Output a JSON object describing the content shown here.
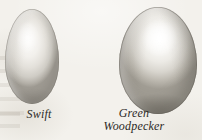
{
  "plate": {
    "background_color": "#f3f1ec",
    "ink_color": "#2c2a26",
    "subject": "bird-egg-comparison-plate"
  },
  "specimens": [
    {
      "id": "swift",
      "caption_lines": [
        "Swift"
      ],
      "shape": "elongated-oval",
      "shell_color": "#e9e6e0",
      "highlight_color": "#fbfaf8",
      "shadow_color": "#9e9a92"
    },
    {
      "id": "green-woodpecker",
      "caption_lines": [
        "Green",
        "Woodpecker"
      ],
      "shape": "broad-oval",
      "shell_color": "#eceae5",
      "highlight_color": "#ffffff",
      "shadow_color": "#a09c93"
    }
  ]
}
